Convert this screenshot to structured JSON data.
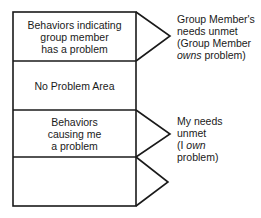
{
  "rows": [
    {
      "label": "Behaviors indicating group member has a problem",
      "lines": [
        "Behaviors indicating",
        "group member",
        "has a problem"
      ]
    },
    {
      "label": "No Problem Area",
      "lines": [
        "No Problem Area"
      ]
    },
    {
      "label": "Behaviors causing me a problem",
      "lines": [
        "Behaviors",
        "causing me",
        "a problem"
      ]
    },
    {
      "label": "",
      "lines": []
    }
  ],
  "annotations": [
    {
      "lines": [
        "Group Member's",
        "needs unmet",
        "(Group Member"
      ],
      "italic_word": "owns",
      "tail": " problem)"
    },
    {
      "lines": [
        "My needs",
        "unmet"
      ],
      "prefix": "(I ",
      "italic_word": "own",
      "tail_line": "problem)"
    }
  ]
}
